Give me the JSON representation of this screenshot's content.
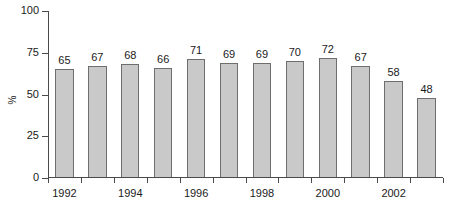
{
  "chart_data": {
    "type": "bar",
    "title": "",
    "subtitle": "",
    "xlabel": "",
    "ylabel": "%",
    "categories": [
      "1992",
      "1993",
      "1994",
      "1995",
      "1996",
      "1997",
      "1998",
      "1999",
      "2000",
      "2001",
      "2002",
      "2003"
    ],
    "values": [
      65,
      67,
      68,
      66,
      71,
      69,
      69,
      70,
      72,
      67,
      58,
      48
    ],
    "data_labels": [
      "65",
      "67",
      "68",
      "66",
      "71",
      "69",
      "69",
      "70",
      "72",
      "67",
      "58",
      "48"
    ],
    "ylim": [
      0,
      100
    ],
    "y_ticks": [
      0,
      25,
      50,
      75,
      100
    ],
    "y_tick_labels": [
      "0",
      "25",
      "50",
      "75",
      "100"
    ],
    "x_tick_labels": [
      "1992",
      "",
      "1994",
      "",
      "1996",
      "",
      "1998",
      "",
      "2000",
      "",
      "2002",
      ""
    ],
    "visible_x_tick_labels": [
      "1992",
      "1994",
      "1996",
      "1998",
      "2000",
      "2002"
    ],
    "grid": false,
    "legend": false,
    "legend_position": "none",
    "colors": {
      "bar_fill": "#c9c9c9",
      "bar_edge": "#6e6e6e",
      "axis": "#4a4a4a",
      "text": "#1a1a1a",
      "background": "#ffffff"
    }
  }
}
